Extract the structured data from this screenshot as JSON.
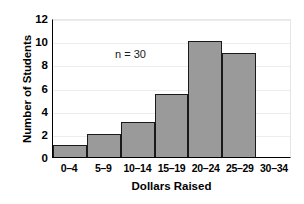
{
  "chart_data": {
    "type": "bar",
    "title": "",
    "subtitle": "",
    "xlabel": "Dollars Raised",
    "ylabel": "Number of Students",
    "categories": [
      "0–4",
      "5–9",
      "10–14",
      "15–19",
      "20–24",
      "25–29",
      "30–34"
    ],
    "values": [
      1,
      2,
      3,
      5.4,
      10,
      9,
      0
    ],
    "series": [
      {
        "name": "Number of Students",
        "values": [
          1,
          2,
          3,
          5.4,
          10,
          9,
          0
        ]
      }
    ],
    "ylim": [
      0,
      12
    ],
    "y_ticks": [
      0,
      2,
      4,
      6,
      8,
      10,
      12
    ],
    "y_tick_labels": [
      "0",
      "2",
      "4",
      "6",
      "8",
      "10",
      "12"
    ],
    "grid": true,
    "grid_axis": "y",
    "legend": false,
    "legend_position": "none",
    "annotations": [
      {
        "name": "sample-size",
        "text": "n = 30",
        "x_category": "0–4",
        "y_value": 11.2
      }
    ],
    "bar_fill_color": "#9a9a9a",
    "bar_edge_color": "#1a1a1a",
    "gridline_color": "#ededed",
    "axis_color": "#000000",
    "background_color": "#ffffff"
  }
}
